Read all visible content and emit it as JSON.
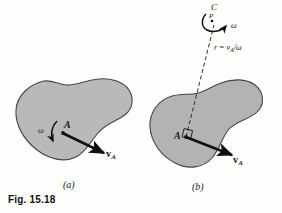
{
  "figure": {
    "caption": "Fig. 15.18",
    "panels": [
      {
        "id": "a",
        "label": "(a)",
        "point_label": "A",
        "omega_label": "ω",
        "velocity_label": "v",
        "velocity_subscript": "A",
        "has_instant_center": false
      },
      {
        "id": "b",
        "label": "(b)",
        "point_label": "A",
        "omega_label": "ω",
        "velocity_label": "v",
        "velocity_subscript": "A",
        "center_label": "C",
        "center_point_label": "P",
        "radius_formula": "r = v",
        "radius_formula_sub": "A",
        "radius_formula_tail": "/ω",
        "has_instant_center": true,
        "right_angle_marker": true
      }
    ],
    "colors": {
      "background": "#fdfdfc",
      "body_fill": "#b9b9b9",
      "body_fill_b": "#b2b2b2",
      "outline": "#3a3a3a",
      "arrow": "#111111",
      "text": "#1a1a1a"
    }
  }
}
